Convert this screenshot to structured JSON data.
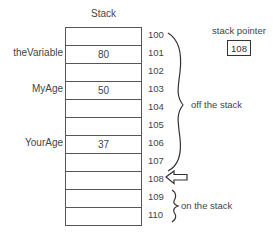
{
  "diagram": {
    "title": "Stack",
    "stack_pointer": {
      "label": "stack pointer",
      "value": "108"
    },
    "rows": [
      {
        "address": "100",
        "variable": "",
        "value": ""
      },
      {
        "address": "101",
        "variable": "theVariable",
        "value": "80"
      },
      {
        "address": "102",
        "variable": "",
        "value": ""
      },
      {
        "address": "103",
        "variable": "MyAge",
        "value": "50"
      },
      {
        "address": "104",
        "variable": "",
        "value": ""
      },
      {
        "address": "105",
        "variable": "",
        "value": ""
      },
      {
        "address": "106",
        "variable": "YourAge",
        "value": "37"
      },
      {
        "address": "107",
        "variable": "",
        "value": ""
      },
      {
        "address": "108",
        "variable": "",
        "value": ""
      },
      {
        "address": "109",
        "variable": "",
        "value": ""
      },
      {
        "address": "110",
        "variable": "",
        "value": ""
      }
    ],
    "brace_labels": {
      "off": "off the stack",
      "on": "on the stack"
    },
    "pointer_arrow": {
      "points_to": "108",
      "icon": "left-arrow-icon"
    }
  }
}
